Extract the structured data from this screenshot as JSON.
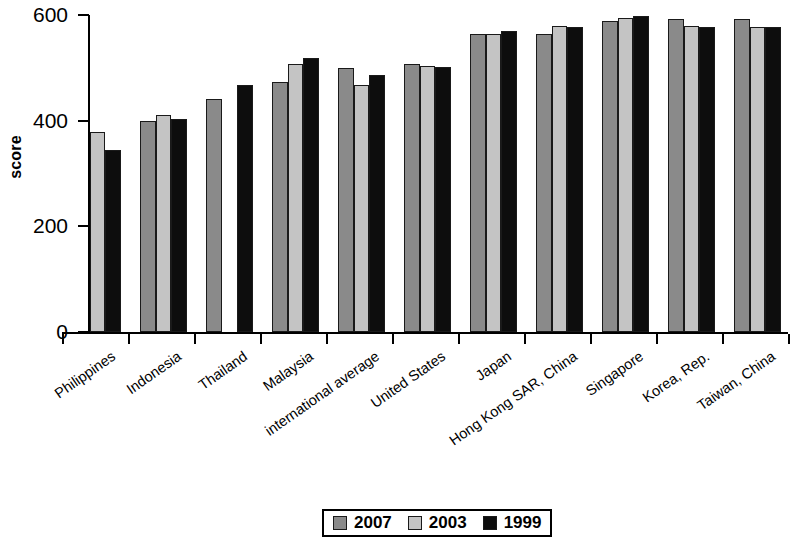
{
  "chart_data": {
    "type": "bar",
    "title": "",
    "subtitle": "",
    "xlabel": "",
    "ylabel": "score",
    "ylim": [
      0,
      600
    ],
    "yticks": [
      0,
      200,
      400,
      600
    ],
    "grid": false,
    "legend_position": "bottom-center",
    "orientation": "vertical",
    "grouping": "grouped",
    "categories": [
      "Philippines",
      "Indonesia",
      "Thailand",
      "Malaysia",
      "international average",
      "United States",
      "Japan",
      "Hong Kong SAR, China",
      "Singapore",
      "Korea, Rep.",
      "Taiwan, China"
    ],
    "series": [
      {
        "name": "2007",
        "color": "#8a8a8a",
        "values": [
          null,
          400,
          441,
          474,
          500,
          508,
          565,
          565,
          589,
          593,
          592
        ]
      },
      {
        "name": "2003",
        "color": "#c4c4c4",
        "values": [
          378,
          411,
          null,
          508,
          467,
          504,
          565,
          580,
          594,
          580,
          578
        ]
      },
      {
        "name": "1999",
        "color": "#0d0d0d",
        "values": [
          345,
          403,
          468,
          519,
          487,
          502,
          570,
          577,
          598,
          578,
          578
        ]
      }
    ]
  },
  "legend": {
    "items": [
      {
        "label": "2007",
        "color": "#8a8a8a"
      },
      {
        "label": "2003",
        "color": "#c4c4c4"
      },
      {
        "label": "1999",
        "color": "#0d0d0d"
      }
    ]
  },
  "axes": {
    "y_title": "score",
    "y_tick_labels": [
      "600",
      "400",
      "200",
      "0"
    ]
  }
}
